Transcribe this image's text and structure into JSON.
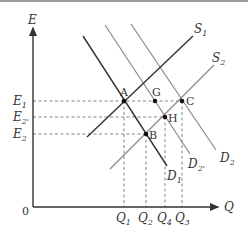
{
  "diagram": {
    "title": "",
    "axes": {
      "y_label": "E",
      "x_label": "Q",
      "origin_label": "0"
    },
    "curves": [
      {
        "id": "S1",
        "label": "S",
        "sub": "1",
        "type": "supply",
        "color": "#333333"
      },
      {
        "id": "S2",
        "label": "S",
        "sub": "2",
        "type": "supply",
        "color": "#8a8a8a"
      },
      {
        "id": "D1",
        "label": "D",
        "sub": "1",
        "type": "demand",
        "color": "#333333"
      },
      {
        "id": "D2p",
        "label": "D",
        "sub": "2'",
        "type": "demand",
        "color": "#8a8a8a"
      },
      {
        "id": "D2",
        "label": "D",
        "sub": "2",
        "type": "demand",
        "color": "#8a8a8a"
      }
    ],
    "points": [
      {
        "id": "A",
        "label": "A"
      },
      {
        "id": "G",
        "label": "G"
      },
      {
        "id": "C",
        "label": "C"
      },
      {
        "id": "H",
        "label": "H"
      },
      {
        "id": "B",
        "label": "B"
      }
    ],
    "y_ticks": [
      {
        "label": "E",
        "sub": "1"
      },
      {
        "label": "E",
        "sub": "2'"
      },
      {
        "label": "E",
        "sub": "2"
      }
    ],
    "x_ticks": [
      {
        "label": "Q",
        "sub": "1"
      },
      {
        "label": "Q",
        "sub": "2"
      },
      {
        "label": "Q",
        "sub": "4"
      },
      {
        "label": "Q",
        "sub": "3"
      }
    ],
    "colors": {
      "dark_line": "#333333",
      "gray_line": "#8a8a8a",
      "dashed": "#666666"
    }
  }
}
